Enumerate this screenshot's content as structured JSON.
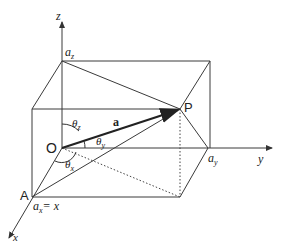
{
  "diagram": {
    "colors": {
      "stroke": "#3a3a3a",
      "vector": "#222222",
      "background": "#ffffff"
    },
    "axes": {
      "x_label": "x",
      "y_label": "y",
      "z_label": "z"
    },
    "points": {
      "origin": "O",
      "point": "P",
      "point_a": "A"
    },
    "vector_label": "a",
    "intercepts": {
      "az": "a",
      "az_sub": "z",
      "ay": "a",
      "ay_sub": "y",
      "ax": "a",
      "ax_sub": "x",
      "ax_eq": "= x"
    },
    "angles": {
      "theta_z": "θ",
      "theta_z_sub": "z",
      "theta_y": "θ",
      "theta_y_sub": "y",
      "theta_x": "θ",
      "theta_x_sub": "x"
    }
  }
}
